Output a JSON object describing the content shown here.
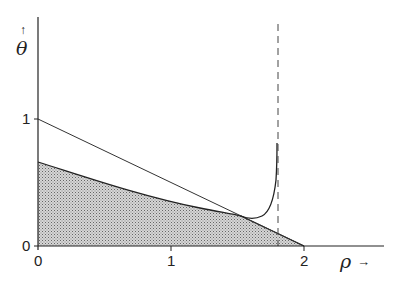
{
  "diagram": {
    "axes": {
      "x_label": "ρ",
      "x_arrow": "→",
      "y_label": "θ",
      "y_arrow": "↑",
      "x_ticks": [
        "0",
        "1",
        "2"
      ],
      "y_ticks": [
        "0",
        "1"
      ]
    },
    "elements": [
      {
        "type": "line",
        "description": "straight line from (0,1) to (2,0)"
      },
      {
        "type": "shaded-region",
        "description": "stippled region under lower curve from θ≈0.66 at ρ=0 to (2,0)"
      },
      {
        "type": "curve",
        "description": "curve tangent to line near ρ≈1.53, minimum ≈0.22, rising steeply toward asymptote"
      },
      {
        "type": "asymptote",
        "description": "vertical dashed line at ρ≈1.8"
      }
    ],
    "colors": {
      "ink": "#222222",
      "shade": "#bdbdbd"
    }
  }
}
